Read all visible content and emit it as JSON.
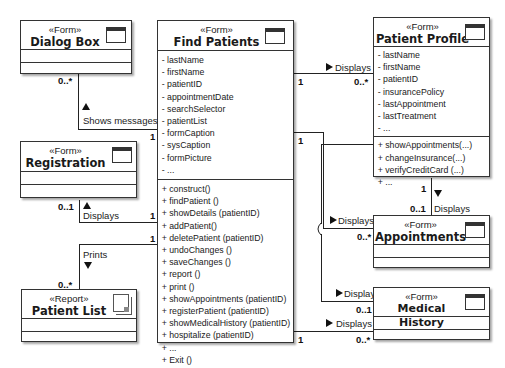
{
  "classes": {
    "dialog_box": {
      "stereotype": "«Form»",
      "name": "Dialog Box",
      "icon": "window-icon"
    },
    "find_patients": {
      "stereotype": "«Form»",
      "name": "Find Patients",
      "icon": "window-icon",
      "attributes": [
        "- lastName",
        "- firstName",
        "- patientID",
        "- appointmentDate",
        "- searchSelector",
        "- patientList",
        "- formCaption",
        "- sysCaption",
        "- formPicture",
        "- ..."
      ],
      "operations": [
        "+ construct()",
        "+ findPatient ()",
        "+ showDetails (patientID)",
        "+ addPatient()",
        "+ deletePatient (patientID)",
        "+ undoChanges ()",
        "+ saveChanges ()",
        "+ report ()",
        "+ print ()",
        "+ showAppointments (patientID)",
        "+ registerPatient (patientID)",
        "+ showMedicalHistory (patientID)",
        "+ hospitalize (patientID)",
        "+ ...",
        "+ Exit ()"
      ]
    },
    "registration": {
      "stereotype": "«Form»",
      "name": "Registration",
      "icon": "window-icon"
    },
    "patient_list": {
      "stereotype": "«Report»",
      "name": "Patient List",
      "icon": "document-icon"
    },
    "patient_profile": {
      "stereotype": "«Form»",
      "name": "Patient Profile",
      "icon": "window-icon",
      "attributes": [
        "- lastName",
        "- firstName",
        "- patientID",
        "- insurancePolicy",
        "- lastAppointment",
        "- lastTreatment",
        "- ..."
      ],
      "operations": [
        "+ showAppointments(...)",
        "+ changeInsurance(...)",
        "+ verifyCreditCard (...)",
        "+ ..."
      ]
    },
    "appointments": {
      "stereotype": "«Form»",
      "name": "Appointments",
      "icon": "window-icon"
    },
    "medical_history": {
      "stereotype": "«Form»",
      "name": "Medical History",
      "icon": "window-icon"
    }
  },
  "associations": {
    "shows_messages": {
      "label": "Shows messages",
      "mult_a": "0..*",
      "mult_b": "1"
    },
    "displays_registration": {
      "label": "Displays",
      "mult_a": "0..1",
      "mult_b": "1"
    },
    "prints": {
      "label": "Prints",
      "mult_a": "0..*",
      "mult_b": "1"
    },
    "displays_profile": {
      "label": "Displays",
      "mult_a": "1",
      "mult_b": "0..*"
    },
    "profile_appointments": {
      "label": "Displays",
      "mult_a": "1",
      "mult_b": "0..1"
    },
    "displays_appointments": {
      "label": "Displays",
      "mult_a": "1",
      "mult_b": "0..*"
    },
    "displays_medical_1": {
      "label": "Displays",
      "mult_b": "0..1"
    },
    "displays_medical_2": {
      "label": "Displays",
      "mult_a": "1",
      "mult_b": "0..*"
    }
  }
}
